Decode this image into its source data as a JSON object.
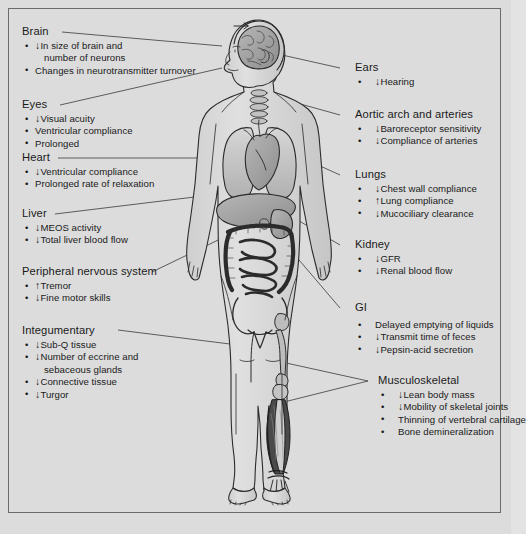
{
  "figure": {
    "background_color": "#dcdcdc",
    "border_color": "#6b6b6b",
    "text_color": "#1a1a1a",
    "arrow_down": "↓",
    "arrow_up": "↑"
  },
  "anatomy": {
    "name": "human-body-anatomical-figure",
    "organs": [
      "brain",
      "spine",
      "lungs",
      "heart",
      "liver",
      "stomach",
      "intestines",
      "kidney",
      "pelvis",
      "femur",
      "tibia",
      "leg-muscles",
      "foot-tendons"
    ]
  },
  "left_labels": [
    {
      "id": "brain",
      "heading": "Brain",
      "items": [
        {
          "arrow": "↓",
          "text": "In size of brain and"
        },
        {
          "arrow": "",
          "text": "number of neurons",
          "continuation": true
        },
        {
          "arrow": "",
          "text": "Changes in neurotransmitter turnover"
        }
      ]
    },
    {
      "id": "eyes",
      "heading": "Eyes",
      "items": [
        {
          "arrow": "↓",
          "text": "Visual acuity"
        },
        {
          "arrow": "",
          "text": "Ventricular compliance"
        },
        {
          "arrow": "",
          "text": "Prolonged"
        }
      ]
    },
    {
      "id": "heart",
      "heading": "Heart",
      "items": [
        {
          "arrow": "↓",
          "text": "Ventricular compliance"
        },
        {
          "arrow": "",
          "text": "Prolonged rate of relaxation"
        }
      ]
    },
    {
      "id": "liver",
      "heading": "Liver",
      "items": [
        {
          "arrow": "↓",
          "text": "MEOS activity"
        },
        {
          "arrow": "↓",
          "text": "Total liver blood flow"
        }
      ]
    },
    {
      "id": "peripheral-nervous-system",
      "heading": "Peripheral nervous system",
      "items": [
        {
          "arrow": "↑",
          "text": "Tremor"
        },
        {
          "arrow": "↓",
          "text": "Fine motor skills"
        }
      ]
    },
    {
      "id": "integumentary",
      "heading": "Integumentary",
      "items": [
        {
          "arrow": "↓",
          "text": "Sub-Q tissue"
        },
        {
          "arrow": "↓",
          "text": "Number of eccrine and"
        },
        {
          "arrow": "",
          "text": "sebaceous glands",
          "continuation": true
        },
        {
          "arrow": "↓",
          "text": "Connective tissue"
        },
        {
          "arrow": "↓",
          "text": "Turgor"
        }
      ]
    }
  ],
  "right_labels": [
    {
      "id": "ears",
      "heading": "Ears",
      "items": [
        {
          "arrow": "↓",
          "text": "Hearing"
        }
      ]
    },
    {
      "id": "aortic-arch-and-arteries",
      "heading": "Aortic arch and arteries",
      "items": [
        {
          "arrow": "↓",
          "text": "Baroreceptor sensitivity"
        },
        {
          "arrow": "↓",
          "text": "Compliance of arteries"
        }
      ]
    },
    {
      "id": "lungs",
      "heading": "Lungs",
      "items": [
        {
          "arrow": "↓",
          "text": "Chest wall compliance"
        },
        {
          "arrow": "↑",
          "text": "Lung compliance"
        },
        {
          "arrow": "↓",
          "text": "Mucociliary clearance"
        }
      ]
    },
    {
      "id": "kidney",
      "heading": "Kidney",
      "items": [
        {
          "arrow": "↓",
          "text": "GFR"
        },
        {
          "arrow": "↓",
          "text": "Renal blood flow"
        }
      ]
    },
    {
      "id": "gi",
      "heading": "GI",
      "items": [
        {
          "arrow": "",
          "text": "Delayed emptying of liquids"
        },
        {
          "arrow": "↓",
          "text": "Transmit time of feces"
        },
        {
          "arrow": "↓",
          "text": "Pepsin-acid secretion"
        }
      ]
    },
    {
      "id": "musculoskeletal",
      "heading": "Musculoskeletal",
      "items": [
        {
          "arrow": "↓",
          "text": "Lean body mass"
        },
        {
          "arrow": "↓",
          "text": "Mobility of skeletal joints"
        },
        {
          "arrow": "",
          "text": "Thinning of vertebral cartilage"
        },
        {
          "arrow": "",
          "text": "Bone demineralization"
        }
      ]
    }
  ]
}
